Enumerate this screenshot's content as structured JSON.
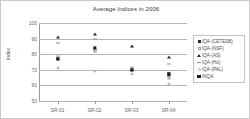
{
  "chart_data": {
    "type": "scatter",
    "title": "Average Indices in 2006",
    "xlabel": "",
    "ylabel": "Index",
    "categories": [
      "SR-01",
      "SR-02",
      "SR-03",
      "SR-04"
    ],
    "ylim": [
      50,
      100
    ],
    "yticks": [
      100,
      90,
      80,
      70,
      60,
      50
    ],
    "grid": true,
    "legend_position": "right",
    "series": [
      {
        "name": "IQA-(CETESB)",
        "marker": "filled-square",
        "color": "#2b2b2b",
        "values": [
          77,
          83,
          70,
          67
        ]
      },
      {
        "name": "IQA-(NSF)",
        "marker": "open-square",
        "color": "#9b9b9b",
        "values": [
          78,
          82,
          71,
          65
        ]
      },
      {
        "name": "IQA-(AS)",
        "marker": "triangle",
        "color": "#2b2b2b",
        "values": [
          91,
          93,
          85,
          78
        ]
      },
      {
        "name": "IQA-(Ho)",
        "marker": "dash",
        "color": "#8f8f8f",
        "values": [
          87,
          90,
          70,
          74
        ]
      },
      {
        "name": "IQA-(PAL)",
        "marker": "open-circle",
        "color": "#a5a5a5",
        "values": [
          71,
          69,
          67,
          61
        ]
      },
      {
        "name": "INQA",
        "marker": "filled-square-large",
        "color": "#1e1e1e",
        "values": [
          77,
          84,
          70,
          67
        ]
      }
    ]
  }
}
